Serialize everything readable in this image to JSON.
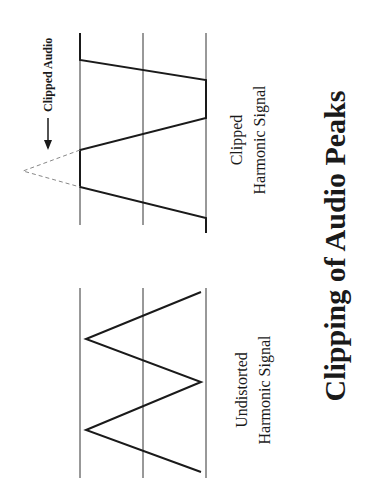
{
  "title": "Clipping of Audio Peaks",
  "annotation": "Clipped Audio",
  "diagrams": [
    {
      "id": "clipped",
      "caption_line1": "Clipped",
      "caption_line2": "Harmonic Signal"
    },
    {
      "id": "undistorted",
      "caption_line1": "Undistorted",
      "caption_line2": "Harmonic Signal"
    }
  ],
  "colors": {
    "line": "#1a1a1a",
    "guide": "#333333",
    "dashed": "#888888",
    "background": "#ffffff"
  }
}
